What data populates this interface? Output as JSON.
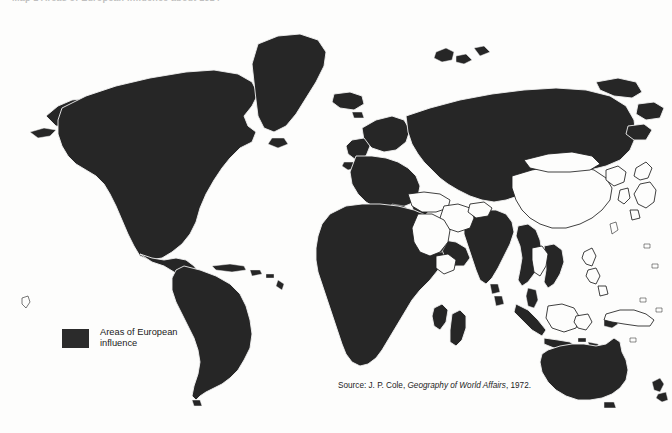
{
  "title": {
    "text": "Map 1  Areas of European influence about 1914"
  },
  "legend": {
    "swatch_name": "legend-swatch-dark",
    "swatch_color": "#2b2b2b",
    "label_line1": "Areas of European",
    "label_line2": "influence"
  },
  "source": {
    "prefix": "Source: J. P. Cole,",
    "work": "Geography of World Affairs",
    "suffix": ", 1972."
  },
  "map": {
    "projection": "world-mercator-style",
    "shaded_color": "#262626",
    "border_color": "#f2f2f2",
    "outline_color": "#1f1f1f",
    "background": "#fdfdfc",
    "shaded_regions": [
      "North America",
      "Canada",
      "United States",
      "Mexico",
      "Central America",
      "Caribbean",
      "Greenland",
      "Iceland",
      "South America",
      "Brazil",
      "Argentina",
      "Chile",
      "Peru",
      "Colombia",
      "Venezuela",
      "Western Europe",
      "United Kingdom",
      "France",
      "Germany",
      "Spain",
      "Portugal",
      "Italy",
      "Scandinavia",
      "Russian Empire",
      "Siberia",
      "Africa",
      "Algeria",
      "Libya",
      "Egypt",
      "Sudan",
      "Nigeria",
      "Congo",
      "South Africa",
      "Madagascar",
      "India",
      "Burma",
      "Indochina",
      "Dutch East Indies",
      "Malaya",
      "Australia",
      "New Zealand"
    ],
    "unshaded_regions": [
      "China",
      "Mongolia",
      "Japan",
      "Korea",
      "Thailand",
      "Persia",
      "Arabia",
      "Ottoman Turkey",
      "Afghanistan",
      "Abyssinia",
      "Philippines",
      "New Guinea",
      "Borneo",
      "Hawaii"
    ]
  }
}
